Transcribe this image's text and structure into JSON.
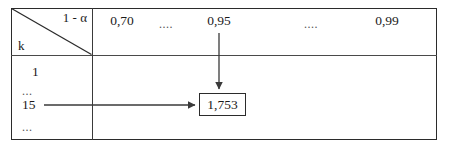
{
  "figure": {
    "kind": "statistical-table-excerpt",
    "corner": {
      "confidence_label": "1 - α",
      "row_variable_label": "k"
    },
    "column_headers": [
      {
        "label": "0,70",
        "x": 122
      },
      {
        "label": "....",
        "x": 166
      },
      {
        "label": "0,95",
        "x": 219
      },
      {
        "label": "....",
        "x": 311
      },
      {
        "label": "0,99",
        "x": 387
      }
    ],
    "row_labels": [
      {
        "label": "1",
        "x": 32,
        "y": 64
      },
      {
        "label": "...",
        "x": 22,
        "y": 83
      },
      {
        "label": "15",
        "x": 22,
        "y": 97
      },
      {
        "label": "...",
        "x": 22,
        "y": 119
      }
    ],
    "highlighted_cell": {
      "value": "1,753",
      "row_key": "15",
      "column_key": "0,95"
    },
    "annotations": {
      "vertical_arrow": {
        "from_label": "0,95",
        "to_label": "1,753",
        "x": 219,
        "y_start": 33,
        "y_end": 91
      },
      "horizontal_arrow": {
        "from_label": "15",
        "to_label": "1,753",
        "y": 105,
        "x_start": 44,
        "x_end": 197
      }
    },
    "colors": {
      "border": "#2b2b2b",
      "inner_line": "#4a4a4a",
      "text": "#1a1a1a",
      "arrow": "#3a3a3a",
      "background": "#ffffff"
    }
  }
}
